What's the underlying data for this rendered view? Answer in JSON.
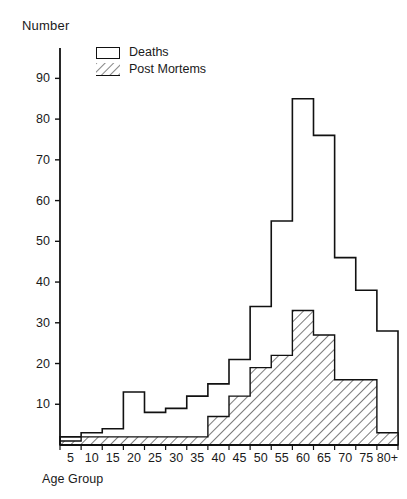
{
  "chart_data": {
    "type": "bar",
    "title": "",
    "xlabel": "Age Group",
    "ylabel": "Number",
    "categories": [
      "5",
      "10",
      "15",
      "20",
      "25",
      "30",
      "35",
      "40",
      "45",
      "50",
      "55",
      "60",
      "65",
      "70",
      "75",
      "80+"
    ],
    "series": [
      {
        "name": "Deaths",
        "values": [
          2,
          3,
          4,
          13,
          8,
          9,
          12,
          15,
          21,
          34,
          55,
          85,
          76,
          46,
          38,
          28
        ]
      },
      {
        "name": "Post Mortems",
        "values": [
          1,
          2,
          2,
          2,
          2,
          2,
          2,
          7,
          12,
          19,
          22,
          33,
          27,
          16,
          16,
          3
        ]
      }
    ],
    "ylim": [
      0,
      95
    ],
    "yticks": [
      10,
      20,
      30,
      40,
      50,
      60,
      70,
      80,
      90
    ],
    "ytick_labels": [
      "10",
      "20",
      "30",
      "40",
      "50",
      "60",
      "70",
      "80",
      "90"
    ],
    "grid": false,
    "legend_position": "top-left",
    "legend_entries": [
      {
        "label": "Deaths",
        "swatch": "open-rectangle"
      },
      {
        "label": "Post Mortems",
        "swatch": "hatched-rectangle"
      }
    ],
    "colors": {
      "line": "#111111",
      "background": "#ffffff",
      "hatch": "#333333"
    }
  }
}
